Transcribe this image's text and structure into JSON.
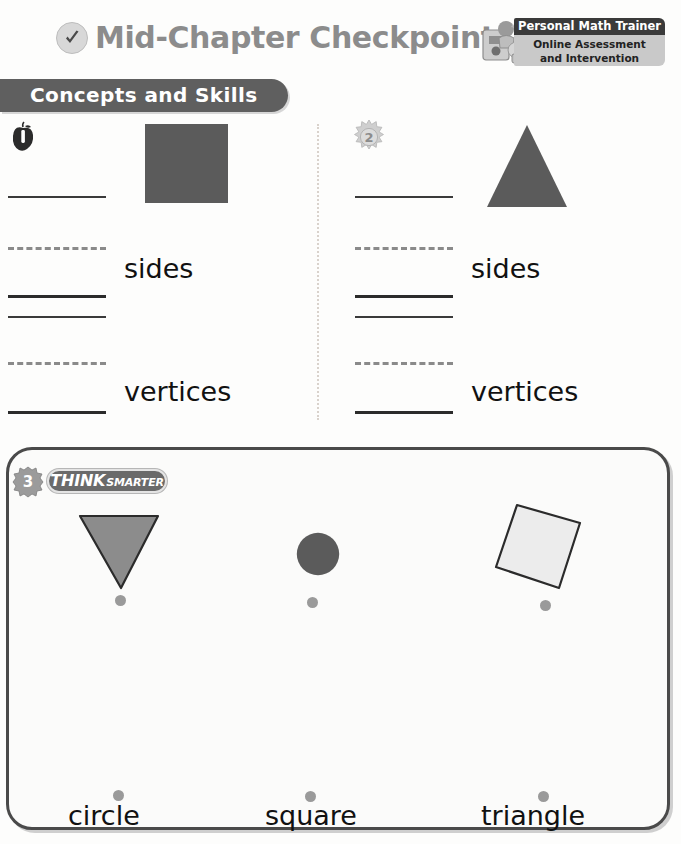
{
  "header": {
    "title": "Mid-Chapter Checkpoint",
    "check_icon": "checkmark-circle-icon",
    "trainer_badge": {
      "title": "Personal Math Trainer",
      "line1": "Online Assessment",
      "line2": "and Intervention",
      "icon": "math-trainer-icon",
      "bar_color": "#3a3a3a",
      "body_color": "#c9c9c9"
    }
  },
  "section_banner": {
    "label": "Concepts and Skills",
    "color": "#5f5f5f"
  },
  "questions": [
    {
      "number": "1",
      "icon": "apple-number-icon",
      "shape": "square",
      "shape_color": "#5b5b5b",
      "label_sides": "sides",
      "label_vertices": "vertices"
    },
    {
      "number": "2",
      "icon": "sunburst-number-icon",
      "shape": "triangle",
      "shape_color": "#5b5b5b",
      "label_sides": "sides",
      "label_vertices": "vertices"
    }
  ],
  "think_smarter": {
    "number": "3",
    "number_icon": "leaf-number-icon",
    "badge_think": "THINK",
    "badge_smarter": "SMARTER",
    "shapes": [
      {
        "name": "triangle-down",
        "fill": "#8c8c8c",
        "stroke": "#2b2b2b"
      },
      {
        "name": "circle",
        "fill": "#5b5b5b",
        "stroke": "#5b5b5b"
      },
      {
        "name": "square-tilted",
        "fill": "#ececec",
        "stroke": "#2b2b2b"
      }
    ],
    "words": [
      "circle",
      "square",
      "triangle"
    ],
    "dot_color": "#9a9a9a"
  }
}
